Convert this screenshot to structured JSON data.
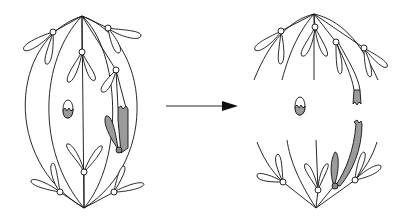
{
  "diagram": {
    "type": "biology-illustration",
    "colors": {
      "line": "#111111",
      "shade": "#9a9a9a",
      "background": "#ffffff"
    },
    "panels": [
      {
        "id": "left",
        "label": "",
        "state": "metaphase spindle with paired chromosomes and a shaded broken chromosome"
      },
      {
        "id": "right",
        "label": "",
        "state": "anaphase: chromosomes moved to poles; shaded fragment separated"
      }
    ],
    "arrow": {
      "from": "left",
      "to": "right",
      "label": ""
    }
  }
}
